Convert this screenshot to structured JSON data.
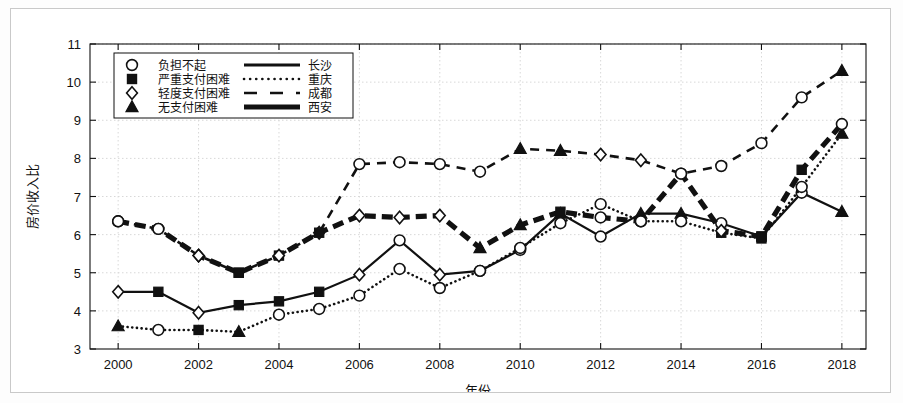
{
  "chart_data": {
    "type": "line",
    "title": "",
    "xlabel": "年份",
    "ylabel": "房价收入比",
    "xlim": [
      1999.3,
      2018.6
    ],
    "ylim": [
      3,
      11
    ],
    "xticks": [
      2000,
      2002,
      2004,
      2006,
      2008,
      2010,
      2012,
      2014,
      2016,
      2018
    ],
    "yticks": [
      3,
      4,
      5,
      6,
      7,
      8,
      9,
      10,
      11
    ],
    "grid": true,
    "legend_position": "top-left",
    "x": [
      2000,
      2001,
      2002,
      2003,
      2004,
      2005,
      2006,
      2007,
      2008,
      2009,
      2010,
      2011,
      2012,
      2013,
      2014,
      2015,
      2016,
      2017,
      2018
    ],
    "series": [
      {
        "name": "长沙",
        "line_style": "solid",
        "marker_by_year": [
          "diamond",
          "square",
          "diamond",
          "square",
          "square",
          "square",
          "diamond",
          "circle",
          "diamond",
          "circle",
          "circle",
          "triangle",
          "circle",
          "triangle",
          "triangle",
          "circle",
          "square",
          "circle",
          "triangle"
        ],
        "values": [
          4.5,
          4.5,
          3.95,
          4.15,
          4.25,
          4.5,
          4.95,
          5.85,
          4.95,
          5.05,
          5.6,
          6.55,
          5.95,
          6.55,
          6.55,
          6.3,
          5.95,
          7.1,
          6.6
        ]
      },
      {
        "name": "重庆",
        "line_style": "dotted",
        "marker_by_year": [
          "triangle",
          "circle",
          "square",
          "triangle",
          "circle",
          "circle",
          "circle",
          "circle",
          "circle",
          "circle",
          "circle",
          "circle",
          "circle",
          "circle",
          "circle",
          "square",
          "square",
          "circle",
          "triangle"
        ],
        "values": [
          3.6,
          3.5,
          3.5,
          3.45,
          3.9,
          4.05,
          4.4,
          5.1,
          4.6,
          5.05,
          5.65,
          6.3,
          6.8,
          6.35,
          6.35,
          6.05,
          5.9,
          7.25,
          8.65
        ]
      },
      {
        "name": "成都",
        "line_style": "dashed",
        "marker_by_year": [
          "circle",
          "circle",
          "diamond",
          "square",
          "square",
          "diamond",
          "circle",
          "circle",
          "circle",
          "circle",
          "triangle",
          "triangle",
          "diamond",
          "diamond",
          "circle",
          "circle",
          "circle",
          "circle",
          "triangle"
        ],
        "values": [
          6.35,
          6.15,
          5.45,
          5.0,
          5.45,
          6.05,
          7.85,
          7.9,
          7.85,
          7.65,
          8.25,
          8.2,
          8.1,
          7.95,
          7.6,
          7.8,
          8.4,
          9.6,
          10.3
        ]
      },
      {
        "name": "西安",
        "line_style": "thick-solid",
        "marker_by_year": [
          "circle",
          "circle",
          "diamond",
          "square",
          "diamond",
          "square",
          "diamond",
          "diamond",
          "diamond",
          "triangle",
          "triangle",
          "square",
          "circle",
          "circle",
          "circle",
          "diamond",
          "square",
          "square",
          "circle"
        ],
        "values": [
          6.35,
          6.15,
          5.45,
          5.0,
          5.45,
          6.05,
          6.5,
          6.45,
          6.5,
          5.65,
          6.25,
          6.6,
          6.45,
          6.35,
          7.6,
          6.1,
          5.95,
          7.7,
          8.9
        ]
      }
    ]
  },
  "legend": {
    "marker_rows": [
      {
        "marker": "circle",
        "label": "负担不起"
      },
      {
        "marker": "square",
        "label": "严重支付困难"
      },
      {
        "marker": "diamond",
        "label": "轻度支付困难"
      },
      {
        "marker": "triangle",
        "label": "无支付困难"
      }
    ],
    "line_rows": [
      {
        "style": "solid",
        "label": "长沙"
      },
      {
        "style": "dotted",
        "label": "重庆"
      },
      {
        "style": "dashed",
        "label": "成都"
      },
      {
        "style": "thick-solid",
        "label": "西安"
      }
    ]
  },
  "colors": {
    "ink": "#111111",
    "grid": "#d8d8d8",
    "frame": "#c9c9c9",
    "background": "#ffffff"
  }
}
